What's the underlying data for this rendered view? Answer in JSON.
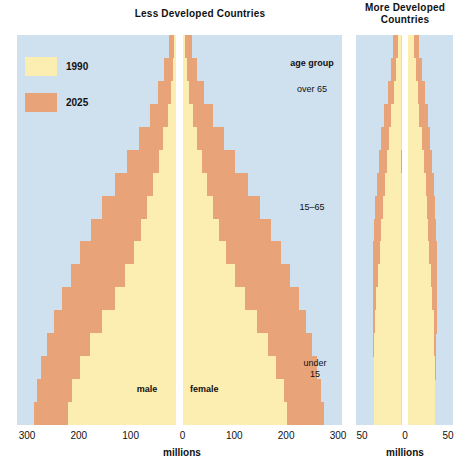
{
  "titles": {
    "less": "Less Developed Countries",
    "more": "More Developed\nCountries",
    "more_line1": "More Developed",
    "more_line2": "Countries"
  },
  "legend": {
    "items": [
      {
        "label": "1990",
        "color": "#fbeeb0"
      },
      {
        "label": "2025",
        "color": "#e8a478"
      }
    ]
  },
  "annotations": {
    "age_group": "age group",
    "over_65": "over 65",
    "mid": "15–65",
    "under_15_line1": "under",
    "under_15_line2": "15",
    "male": "male",
    "female": "female"
  },
  "axes": {
    "less": {
      "unit": "millions",
      "ticks": [
        "300",
        "200",
        "100",
        "0",
        "100",
        "200",
        "300"
      ],
      "max": 300
    },
    "more": {
      "unit": "millions",
      "ticks": [
        "50",
        "0",
        "50"
      ],
      "max": 50
    }
  },
  "colors": {
    "plot_background": "#cfe0ef",
    "year_1990": "#fbeeb0",
    "year_2025": "#e8a478",
    "center_divider": "#ffffff",
    "text": "#111111",
    "page_background": "#ffffff"
  },
  "chart_data": {
    "type": "bar",
    "subtype": "population-pyramid",
    "xlabel": "millions",
    "ylabel": "age group",
    "grid": false,
    "legend_position": "top-left",
    "age_groups": [
      "80+",
      "75-79",
      "70-74",
      "65-69",
      "60-64",
      "55-59",
      "50-54",
      "45-49",
      "40-44",
      "35-39",
      "30-34",
      "25-29",
      "20-24",
      "15-19",
      "10-14",
      "5-9",
      "0-4"
    ],
    "age_group_bands": {
      "over 65": [
        "80+",
        "75-79",
        "70-74",
        "65-69"
      ],
      "15-65": [
        "60-64",
        "55-59",
        "50-54",
        "45-49",
        "40-44",
        "35-39",
        "30-34",
        "25-29",
        "20-24",
        "15-19"
      ],
      "under 15": [
        "10-14",
        "5-9",
        "0-4"
      ]
    },
    "panels": [
      {
        "name": "Less Developed Countries",
        "xlim": [
          -300,
          300
        ],
        "xticks": [
          -300,
          -200,
          -100,
          0,
          100,
          200,
          300
        ],
        "series": [
          {
            "name": "1990",
            "side": "male",
            "values": [
              3,
              6,
              10,
              16,
              24,
              33,
              43,
              54,
              66,
              80,
              96,
              116,
              140,
              163,
              181,
              196,
              203
            ]
          },
          {
            "name": "1990",
            "side": "female",
            "values": [
              4,
              7,
              12,
              18,
              26,
              35,
              45,
              56,
              68,
              82,
              98,
              117,
              140,
              161,
              176,
              190,
              196
            ]
          },
          {
            "name": "2025",
            "side": "male",
            "values": [
              13,
              22,
              34,
              50,
              70,
              92,
              116,
              139,
              161,
              181,
              199,
              216,
              231,
              244,
              254,
              262,
              268
            ]
          },
          {
            "name": "2025",
            "side": "female",
            "values": [
              17,
              27,
              40,
              57,
              77,
              99,
              122,
              145,
              166,
              185,
              202,
              218,
              232,
              244,
              253,
              261,
              266
            ]
          }
        ]
      },
      {
        "name": "More Developed Countries",
        "xlim": [
          -50,
          50
        ],
        "xticks": [
          -50,
          0,
          50
        ],
        "series": [
          {
            "name": "1990",
            "side": "male",
            "values": [
              4,
              6,
              8,
              11,
              14,
              16,
              18,
              20,
              22,
              24,
              26,
              28,
              29,
              30,
              30,
              30,
              30
            ]
          },
          {
            "name": "1990",
            "side": "female",
            "values": [
              7,
              9,
              11,
              13,
              16,
              18,
              20,
              21,
              23,
              24,
              26,
              27,
              29,
              29,
              30,
              30,
              30
            ]
          },
          {
            "name": "2025",
            "side": "male",
            "values": [
              9,
              12,
              15,
              19,
              22,
              25,
              27,
              29,
              30,
              31,
              31,
              31,
              31,
              31,
              30,
              30,
              30
            ]
          },
          {
            "name": "2025",
            "side": "female",
            "values": [
              13,
              16,
              19,
              22,
              25,
              27,
              29,
              30,
              31,
              32,
              32,
              32,
              32,
              31,
              31,
              30,
              30
            ]
          }
        ]
      }
    ]
  }
}
